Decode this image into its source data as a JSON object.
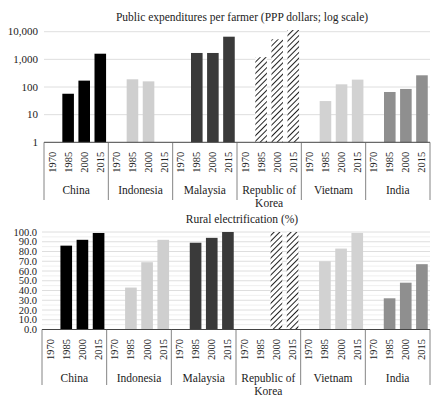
{
  "chart_data": [
    {
      "type": "bar",
      "title": "Public expenditures per farmer (PPP dollars; log scale)",
      "xlabel": "",
      "ylabel": "",
      "yscale": "log",
      "ylim": [
        1,
        10000
      ],
      "yticks": [
        "1",
        "10",
        "100",
        "1,000",
        "10,000"
      ],
      "grid": true,
      "years": [
        "1970",
        "1985",
        "2000",
        "2015"
      ],
      "groups": [
        {
          "name": "China",
          "label_lines": [
            "China"
          ],
          "fill": "#000000",
          "pattern": "solid",
          "values": [
            null,
            57,
            170,
            1600
          ]
        },
        {
          "name": "Indonesia",
          "label_lines": [
            "Indonesia"
          ],
          "fill": "#cfcfcf",
          "pattern": "solid",
          "values": [
            null,
            190,
            160,
            null
          ]
        },
        {
          "name": "Malaysia",
          "label_lines": [
            "Malaysia"
          ],
          "fill": "#3a3a3a",
          "pattern": "solid",
          "values": [
            null,
            1700,
            1700,
            6600
          ]
        },
        {
          "name": "Republic of Korea",
          "label_lines": [
            "Republic of",
            "Korea"
          ],
          "fill": "#222222",
          "pattern": "hatch",
          "values": [
            null,
            1200,
            5300,
            11500
          ]
        },
        {
          "name": "Vietnam",
          "label_lines": [
            "Vietnam"
          ],
          "fill": "#d2d2d2",
          "pattern": "solid",
          "values": [
            null,
            31,
            125,
            185
          ]
        },
        {
          "name": "India",
          "label_lines": [
            "India"
          ],
          "fill": "#8f8f8f",
          "pattern": "solid",
          "values": [
            null,
            66,
            85,
            265
          ]
        }
      ]
    },
    {
      "type": "bar",
      "title": "Rural electrification (%)",
      "xlabel": "",
      "ylabel": "",
      "yscale": "linear",
      "ylim": [
        0,
        100
      ],
      "yticks": [
        "0.0",
        "10.0",
        "20.0",
        "30.0",
        "40.0",
        "50.0",
        "60.0",
        "70.0",
        "80.0",
        "90.0",
        "100.0"
      ],
      "grid": true,
      "years": [
        "1970",
        "1985",
        "2000",
        "2015"
      ],
      "groups": [
        {
          "name": "China",
          "label_lines": [
            "China"
          ],
          "fill": "#000000",
          "pattern": "solid",
          "values": [
            null,
            86,
            92,
            99
          ]
        },
        {
          "name": "Indonesia",
          "label_lines": [
            "Indonesia"
          ],
          "fill": "#cfcfcf",
          "pattern": "solid",
          "values": [
            null,
            43,
            69,
            92
          ]
        },
        {
          "name": "Malaysia",
          "label_lines": [
            "Malaysia"
          ],
          "fill": "#3a3a3a",
          "pattern": "solid",
          "values": [
            null,
            89,
            94,
            100
          ]
        },
        {
          "name": "Republic of Korea",
          "label_lines": [
            "Republic of",
            "Korea"
          ],
          "fill": "#222222",
          "pattern": "hatch",
          "values": [
            null,
            null,
            100,
            100
          ]
        },
        {
          "name": "Vietnam",
          "label_lines": [
            "Vietnam"
          ],
          "fill": "#d2d2d2",
          "pattern": "solid",
          "values": [
            null,
            70,
            83,
            99
          ]
        },
        {
          "name": "India",
          "label_lines": [
            "India"
          ],
          "fill": "#8f8f8f",
          "pattern": "solid",
          "values": [
            null,
            32,
            48,
            67
          ]
        }
      ]
    }
  ]
}
